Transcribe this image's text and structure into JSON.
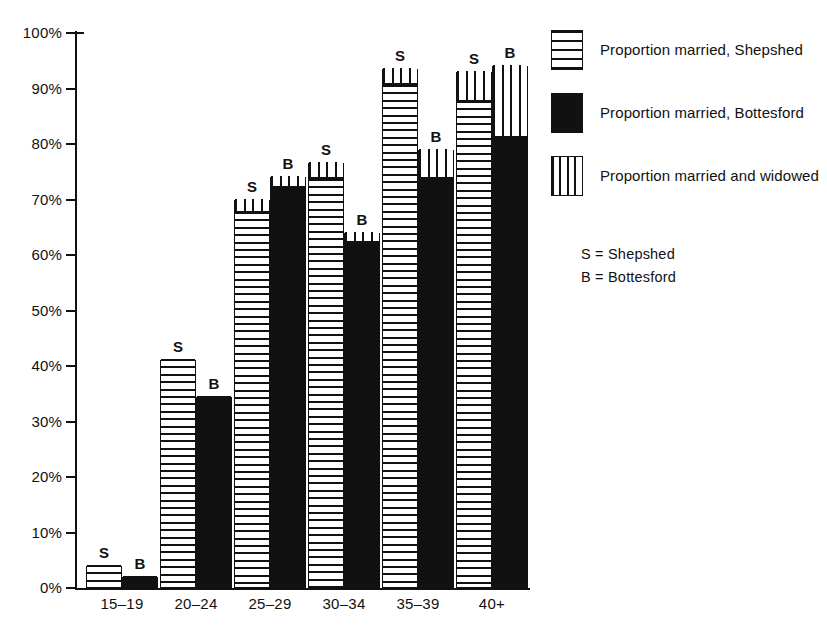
{
  "chart_data": {
    "type": "bar",
    "title": "",
    "subtitle": "",
    "xlabel": "",
    "ylabel": "",
    "ylim": [
      0,
      100
    ],
    "grid": false,
    "stacked": true,
    "legend_position": "right",
    "categories": [
      "15–19",
      "20–24",
      "25–29",
      "30–34",
      "35–39",
      "40+"
    ],
    "y_ticks": [
      {
        "value": 0,
        "label": "0%"
      },
      {
        "value": 10,
        "label": "10%"
      },
      {
        "value": 20,
        "label": "20%"
      },
      {
        "value": 30,
        "label": "30%"
      },
      {
        "value": 40,
        "label": "40%"
      },
      {
        "value": 50,
        "label": "50%"
      },
      {
        "value": 60,
        "label": "60%"
      },
      {
        "value": 70,
        "label": "70%"
      },
      {
        "value": 80,
        "label": "80%"
      },
      {
        "value": 90,
        "label": "90%"
      },
      {
        "value": 100,
        "label": "100%"
      }
    ],
    "series": [
      {
        "name": "Proportion married, Shepshed",
        "pattern": "horizontal-hatch",
        "values": [
          4,
          41,
          67.5,
          73.5,
          90.5,
          87.5
        ]
      },
      {
        "name": "Proportion married, Bottesford",
        "pattern": "solid-black",
        "values": [
          2,
          34.5,
          72,
          62,
          73.5,
          81
        ]
      },
      {
        "name": "Proportion married and widowed, Shepshed",
        "pattern": "vertical-hatch",
        "values": [
          4,
          41,
          70,
          76.5,
          93.5,
          93
        ]
      },
      {
        "name": "Proportion married and widowed, Bottesford",
        "pattern": "vertical-hatch",
        "values": [
          2,
          34.5,
          74,
          64,
          79,
          94
        ]
      }
    ],
    "bars": [
      {
        "group": "15–19",
        "town": "Shepshed",
        "letter": "S",
        "married": 4,
        "total": 4,
        "fill": "horizontal-hatch"
      },
      {
        "group": "15–19",
        "town": "Bottesford",
        "letter": "B",
        "married": 2,
        "total": 2,
        "fill": "solid-black"
      },
      {
        "group": "20–24",
        "town": "Shepshed",
        "letter": "S",
        "married": 41,
        "total": 41,
        "fill": "horizontal-hatch"
      },
      {
        "group": "20–24",
        "town": "Bottesford",
        "letter": "B",
        "married": 34.5,
        "total": 34.5,
        "fill": "solid-black"
      },
      {
        "group": "25–29",
        "town": "Shepshed",
        "letter": "S",
        "married": 67.5,
        "total": 70,
        "fill": "horizontal-hatch"
      },
      {
        "group": "25–29",
        "town": "Bottesford",
        "letter": "B",
        "married": 72,
        "total": 74,
        "fill": "solid-black"
      },
      {
        "group": "30–34",
        "town": "Shepshed",
        "letter": "S",
        "married": 73.5,
        "total": 76.5,
        "fill": "horizontal-hatch"
      },
      {
        "group": "30–34",
        "town": "Bottesford",
        "letter": "B",
        "married": 62,
        "total": 64,
        "fill": "solid-black"
      },
      {
        "group": "35–39",
        "town": "Shepshed",
        "letter": "S",
        "married": 90.5,
        "total": 93.5,
        "fill": "horizontal-hatch"
      },
      {
        "group": "35–39",
        "town": "Bottesford",
        "letter": "B",
        "married": 73.5,
        "total": 79,
        "fill": "solid-black"
      },
      {
        "group": "40+",
        "town": "Shepshed",
        "letter": "S",
        "married": 87.5,
        "total": 93,
        "fill": "horizontal-hatch"
      },
      {
        "group": "40+",
        "town": "Bottesford",
        "letter": "B",
        "married": 81,
        "total": 94,
        "fill": "solid-black"
      }
    ]
  },
  "legend": {
    "items": [
      {
        "label": "Proportion married, Shepshed",
        "pattern": "horizontal-hatch"
      },
      {
        "label": "Proportion married, Bottesford",
        "pattern": "solid-black"
      },
      {
        "label": "Proportion married and widowed",
        "pattern": "vertical-hatch"
      }
    ],
    "key": [
      {
        "text": "S = Shepshed"
      },
      {
        "text": "B = Bottesford"
      }
    ]
  },
  "colors": {
    "ink": "#111111",
    "paper": "#ffffff"
  }
}
